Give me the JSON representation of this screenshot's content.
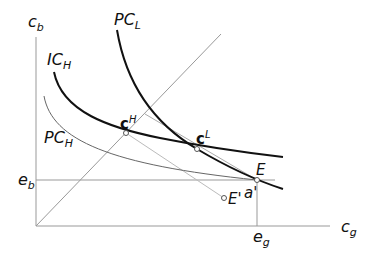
{
  "diagram": {
    "title": "",
    "axes": {
      "y_label": {
        "main": "c",
        "sub": "b"
      },
      "x_label": {
        "main": "c",
        "sub": "g"
      }
    },
    "ticks": {
      "e_b": {
        "main": "e",
        "sub": "b"
      },
      "e_g": {
        "main": "e",
        "sub": "g"
      }
    },
    "curves": [
      {
        "id": "PC_L",
        "main": "PC",
        "sub": "L",
        "style": "thick"
      },
      {
        "id": "IC_H",
        "main": "IC",
        "sub": "H",
        "style": "thick"
      },
      {
        "id": "PC_H",
        "main": "PC",
        "sub": "H",
        "style": "thin"
      }
    ],
    "points": [
      {
        "id": "cH",
        "main": "c",
        "sup": "H"
      },
      {
        "id": "cL",
        "main": "c",
        "sup": "L"
      },
      {
        "id": "E",
        "label": "E"
      },
      {
        "id": "E_prime",
        "label": "E'"
      }
    ],
    "annotations": {
      "a_prime": "a'"
    },
    "colors": {
      "thick_curve": "#111111",
      "thin_curve": "#555555",
      "axis": "#888888",
      "light_line": "#aaaaaa"
    }
  }
}
